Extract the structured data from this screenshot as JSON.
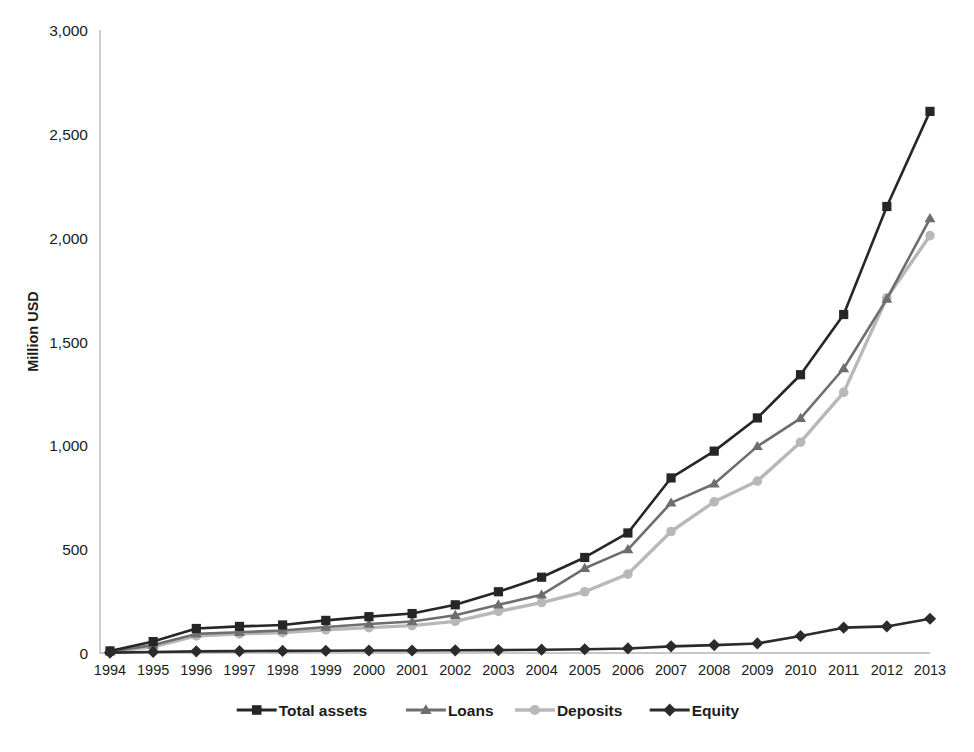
{
  "figure": {
    "cut_off_title": "",
    "background_color": "#ffffff"
  },
  "chart_data": {
    "type": "line",
    "title": "",
    "subtitle": "",
    "xlabel": "",
    "ylabel": "Million USD",
    "ylim": [
      0,
      3000
    ],
    "yticks": [
      0,
      500,
      1000,
      1500,
      2000,
      2500,
      3000
    ],
    "ytick_labels": [
      "0",
      "500",
      "1,000",
      "1,500",
      "2,000",
      "2,500",
      "3,000"
    ],
    "grid": false,
    "legend_position": "bottom",
    "categories": [
      "1994",
      "1995",
      "1996",
      "1997",
      "1998",
      "1999",
      "2000",
      "2001",
      "2002",
      "2003",
      "2004",
      "2005",
      "2006",
      "2007",
      "2008",
      "2009",
      "2010",
      "2011",
      "2012",
      "2013"
    ],
    "series": [
      {
        "name": "Total assets",
        "color": "#262626",
        "marker": "square",
        "values": [
          10,
          55,
          118,
          128,
          135,
          157,
          175,
          190,
          232,
          295,
          365,
          460,
          578,
          843,
          972,
          1132,
          1340,
          1630,
          2150,
          2608
        ]
      },
      {
        "name": "Loans",
        "color": "#6e6e6e",
        "marker": "triangle",
        "values": [
          8,
          38,
          92,
          100,
          108,
          125,
          140,
          152,
          182,
          232,
          280,
          408,
          498,
          723,
          815,
          995,
          1130,
          1370,
          1705,
          2092
        ]
      },
      {
        "name": "Deposits",
        "color": "#b8b8b8",
        "marker": "circle",
        "values": [
          7,
          30,
          82,
          92,
          98,
          112,
          122,
          132,
          152,
          200,
          243,
          295,
          380,
          585,
          728,
          828,
          1015,
          1255,
          1710,
          2010
        ]
      },
      {
        "name": "Equity",
        "color": "#2b2b2b",
        "marker": "diamond",
        "values": [
          2,
          5,
          8,
          9,
          10,
          11,
          12,
          12,
          13,
          14,
          16,
          18,
          22,
          32,
          38,
          46,
          82,
          122,
          128,
          165
        ]
      }
    ]
  },
  "legend": {
    "entries": [
      {
        "label": "Total assets",
        "color": "#262626",
        "marker": "square"
      },
      {
        "label": "Loans",
        "color": "#6e6e6e",
        "marker": "triangle"
      },
      {
        "label": "Deposits",
        "color": "#b8b8b8",
        "marker": "circle"
      },
      {
        "label": "Equity",
        "color": "#2b2b2b",
        "marker": "diamond"
      }
    ]
  }
}
